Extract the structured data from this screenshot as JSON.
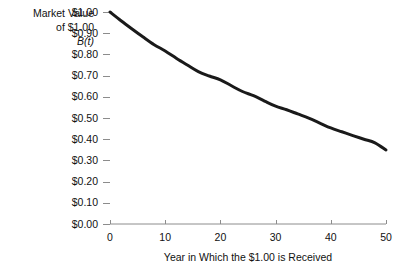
{
  "chart_data": {
    "type": "line",
    "title": "",
    "subtitle": "",
    "xlabel": "Year in Which the $1.00 is Received",
    "ylabel": "Market Value of $1.00 B(t)",
    "ylabel_lines": [
      "Market Value",
      "of $1.00",
      "B(t)"
    ],
    "xlim": [
      0,
      50
    ],
    "ylim": [
      0,
      1.0
    ],
    "grid": false,
    "legend": "none",
    "x_ticks": [
      0,
      10,
      20,
      30,
      40,
      50
    ],
    "x_tick_labels": [
      "0",
      "10",
      "20",
      "30",
      "40",
      "50"
    ],
    "y_ticks": [
      0.0,
      0.1,
      0.2,
      0.3,
      0.4,
      0.5,
      0.6,
      0.7,
      0.8,
      0.9,
      1.0
    ],
    "y_tick_labels": [
      "$0.00",
      "$0.10",
      "$0.20",
      "$0.30",
      "$0.40",
      "$0.50",
      "$0.60",
      "$0.70",
      "$0.80",
      "$0.90",
      "$1.00"
    ],
    "series": [
      {
        "name": "B(t)",
        "color": "#1a1a1a",
        "line_width": 3,
        "x": [
          0,
          2,
          4,
          6,
          8,
          10,
          12,
          14,
          16,
          18,
          20,
          22,
          24,
          26,
          28,
          30,
          32,
          34,
          36,
          38,
          40,
          42,
          44,
          46,
          48,
          50
        ],
        "y": [
          1.0,
          0.959,
          0.92,
          0.882,
          0.846,
          0.816,
          0.782,
          0.75,
          0.719,
          0.698,
          0.68,
          0.652,
          0.625,
          0.605,
          0.58,
          0.556,
          0.539,
          0.519,
          0.499,
          0.476,
          0.453,
          0.435,
          0.417,
          0.4,
          0.383,
          0.349
        ]
      }
    ],
    "annotations": []
  },
  "axis": {
    "y_caption_line1": "Market Value",
    "y_caption_line2": "of $1.00",
    "y_caption_line3": "B(t)",
    "x_title": "Year in Which the $1.00 is Received"
  },
  "colors": {
    "background": "#ffffff",
    "axis": "#8c8c8c",
    "curve": "#1a1a1a",
    "text": "#111111"
  }
}
